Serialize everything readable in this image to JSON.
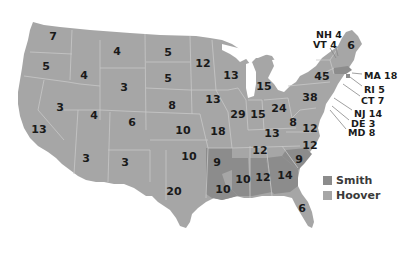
{
  "colors": {
    "smith": "#8c8c8c",
    "hoover": "#a6a6a6",
    "borders": "#c8c8c8",
    "background": "#ffffff"
  },
  "legend": [
    {
      "candidate": "Smith",
      "color": "#8c8c8c"
    },
    {
      "candidate": "Hoover",
      "color": "#a6a6a6"
    }
  ],
  "states": [
    {
      "label": "7",
      "state": "WA",
      "winner": "Hoover",
      "x": 53,
      "y": 36
    },
    {
      "label": "5",
      "state": "OR",
      "winner": "Hoover",
      "x": 46,
      "y": 66
    },
    {
      "label": "4",
      "state": "ID",
      "winner": "Hoover",
      "x": 84,
      "y": 75
    },
    {
      "label": "4",
      "state": "MT",
      "winner": "Hoover",
      "x": 117,
      "y": 51
    },
    {
      "label": "3",
      "state": "WY",
      "winner": "Hoover",
      "x": 124,
      "y": 87
    },
    {
      "label": "5",
      "state": "ND",
      "winner": "Hoover",
      "x": 168,
      "y": 52
    },
    {
      "label": "5",
      "state": "SD",
      "winner": "Hoover",
      "x": 168,
      "y": 78
    },
    {
      "label": "8",
      "state": "NE",
      "winner": "Hoover",
      "x": 172,
      "y": 105
    },
    {
      "label": "3",
      "state": "NV",
      "winner": "Hoover",
      "x": 60,
      "y": 107
    },
    {
      "label": "4",
      "state": "UT",
      "winner": "Hoover",
      "x": 94,
      "y": 115
    },
    {
      "label": "6",
      "state": "CO",
      "winner": "Hoover",
      "x": 132,
      "y": 122
    },
    {
      "label": "13",
      "state": "CA",
      "winner": "Hoover",
      "x": 39,
      "y": 129
    },
    {
      "label": "3",
      "state": "AZ",
      "winner": "Hoover",
      "x": 86,
      "y": 158
    },
    {
      "label": "3",
      "state": "NM",
      "winner": "Hoover",
      "x": 125,
      "y": 162
    },
    {
      "label": "10",
      "state": "KS",
      "winner": "Hoover",
      "x": 183,
      "y": 130
    },
    {
      "label": "10",
      "state": "OK",
      "winner": "Hoover",
      "x": 189,
      "y": 156
    },
    {
      "label": "20",
      "state": "TX",
      "winner": "Hoover",
      "x": 174,
      "y": 191
    },
    {
      "label": "12",
      "state": "MN",
      "winner": "Hoover",
      "x": 203,
      "y": 63
    },
    {
      "label": "13",
      "state": "IA",
      "winner": "Hoover",
      "x": 213,
      "y": 99
    },
    {
      "label": "18",
      "state": "MO",
      "winner": "Hoover",
      "x": 218,
      "y": 131
    },
    {
      "label": "9",
      "state": "AR",
      "winner": "Smith",
      "x": 217,
      "y": 162
    },
    {
      "label": "10",
      "state": "LA",
      "winner": "Smith",
      "x": 223,
      "y": 189
    },
    {
      "label": "13",
      "state": "WI",
      "winner": "Hoover",
      "x": 231,
      "y": 75
    },
    {
      "label": "29",
      "state": "IL",
      "winner": "Hoover",
      "x": 238,
      "y": 114
    },
    {
      "label": "15",
      "state": "MI",
      "winner": "Hoover",
      "x": 264,
      "y": 86
    },
    {
      "label": "15",
      "state": "IN",
      "winner": "Hoover",
      "x": 258,
      "y": 114
    },
    {
      "label": "24",
      "state": "OH",
      "winner": "Hoover",
      "x": 279,
      "y": 108
    },
    {
      "label": "13",
      "state": "KY",
      "winner": "Hoover",
      "x": 272,
      "y": 133
    },
    {
      "label": "12",
      "state": "TN",
      "winner": "Hoover",
      "x": 260,
      "y": 150
    },
    {
      "label": "10",
      "state": "MS",
      "winner": "Smith",
      "x": 243,
      "y": 179
    },
    {
      "label": "12",
      "state": "AL",
      "winner": "Smith",
      "x": 263,
      "y": 177
    },
    {
      "label": "14",
      "state": "GA",
      "winner": "Smith",
      "x": 285,
      "y": 175
    },
    {
      "label": "9",
      "state": "SC",
      "winner": "Smith",
      "x": 299,
      "y": 159
    },
    {
      "label": "6",
      "state": "FL",
      "winner": "Hoover",
      "x": 302,
      "y": 208
    },
    {
      "label": "8",
      "state": "WV",
      "winner": "Hoover",
      "x": 293,
      "y": 122
    },
    {
      "label": "12",
      "state": "VA",
      "winner": "Hoover",
      "x": 310,
      "y": 128
    },
    {
      "label": "12",
      "state": "NC",
      "winner": "Hoover",
      "x": 310,
      "y": 145
    },
    {
      "label": "38",
      "state": "PA",
      "winner": "Hoover",
      "x": 310,
      "y": 97
    },
    {
      "label": "45",
      "state": "NY",
      "winner": "Hoover",
      "x": 322,
      "y": 76
    },
    {
      "label": "6",
      "state": "ME",
      "winner": "Hoover",
      "x": 351,
      "y": 45
    }
  ],
  "callouts": [
    {
      "label": "NH 4",
      "state": "NH",
      "winner": "Hoover",
      "x": 316,
      "y": 30
    },
    {
      "label": "VT 4",
      "state": "VT",
      "winner": "Hoover",
      "x": 313,
      "y": 40
    },
    {
      "label": "MA 18",
      "state": "MA",
      "winner": "Smith",
      "x": 364,
      "y": 71
    },
    {
      "label": "RI 5",
      "state": "RI",
      "winner": "Smith",
      "x": 364,
      "y": 85
    },
    {
      "label": "CT 7",
      "state": "CT",
      "winner": "Hoover",
      "x": 361,
      "y": 96
    },
    {
      "label": "NJ 14",
      "state": "NJ",
      "winner": "Hoover",
      "x": 354,
      "y": 109
    },
    {
      "label": "DE 3",
      "state": "DE",
      "winner": "Hoover",
      "x": 351,
      "y": 119
    },
    {
      "label": "MD 8",
      "state": "MD",
      "winner": "Hoover",
      "x": 348,
      "y": 128
    }
  ]
}
